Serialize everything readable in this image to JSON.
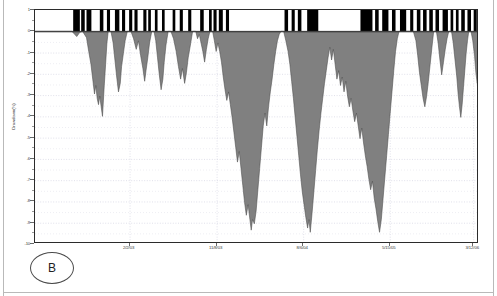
{
  "figure": {
    "panel_tag": "B",
    "background": "#ffffff",
    "frame_color": "#2b2b2b"
  },
  "chart_data": {
    "type": "area",
    "title": "",
    "subtitle": "",
    "xlabel": "",
    "ylabel": "Drawdown(%)",
    "ylim": [
      -10,
      1
    ],
    "yticks": [
      1,
      0,
      -1,
      -2,
      -3,
      -4,
      -5,
      -6,
      -7,
      -8,
      -9,
      -10
    ],
    "ytick_labels": [
      "1",
      "0",
      "-1",
      "-2",
      "-3",
      "-4",
      "-5",
      "-6",
      "-7",
      "-8",
      "-9",
      "-10"
    ],
    "minor_yticks": [
      0.5,
      -0.5,
      -1.5,
      -2.5,
      -3.5,
      -4.5,
      -5.5,
      -6.5,
      -7.5,
      -8.5,
      -9.5
    ],
    "grid": true,
    "grid_color": "#d8d8e4",
    "grid_style": "dotted",
    "legend": "none",
    "xtick_labels": [
      "2/2/03",
      "11/8/03",
      "8/6/04",
      "5/15/05",
      "3/12/06"
    ],
    "xtick_positions": [
      0.213,
      0.409,
      0.604,
      0.799,
      0.987
    ],
    "xlim_labels": [
      "",
      ""
    ],
    "series": [
      {
        "name": "Drawdown(%)",
        "fill_color": "#808080",
        "line_color": "#4a4a4a",
        "baseline": 0,
        "points": [
          [
            0.0,
            0.0
          ],
          [
            0.018,
            0.0
          ],
          [
            0.04,
            0.0
          ],
          [
            0.062,
            0.0
          ],
          [
            0.083,
            0.0
          ],
          [
            0.094,
            -0.25
          ],
          [
            0.101,
            -0.05
          ],
          [
            0.107,
            0.0
          ],
          [
            0.116,
            -0.3
          ],
          [
            0.121,
            -0.95
          ],
          [
            0.126,
            -1.55
          ],
          [
            0.13,
            -2.25
          ],
          [
            0.134,
            -2.95
          ],
          [
            0.137,
            -2.55
          ],
          [
            0.14,
            -3.15
          ],
          [
            0.143,
            -3.45
          ],
          [
            0.146,
            -3.05
          ],
          [
            0.149,
            -3.55
          ],
          [
            0.152,
            -4.0
          ],
          [
            0.156,
            -2.55
          ],
          [
            0.159,
            -1.55
          ],
          [
            0.162,
            -0.55
          ],
          [
            0.165,
            0.0
          ],
          [
            0.171,
            0.0
          ],
          [
            0.176,
            -0.55
          ],
          [
            0.18,
            -1.35
          ],
          [
            0.184,
            -2.15
          ],
          [
            0.188,
            -2.85
          ],
          [
            0.192,
            -2.45
          ],
          [
            0.195,
            -1.65
          ],
          [
            0.199,
            -1.05
          ],
          [
            0.203,
            -0.45
          ],
          [
            0.208,
            0.0
          ],
          [
            0.216,
            0.0
          ],
          [
            0.222,
            -0.35
          ],
          [
            0.228,
            -0.85
          ],
          [
            0.233,
            -0.45
          ],
          [
            0.238,
            -1.15
          ],
          [
            0.243,
            -1.75
          ],
          [
            0.247,
            -2.35
          ],
          [
            0.25,
            -1.85
          ],
          [
            0.254,
            -1.25
          ],
          [
            0.258,
            -0.55
          ],
          [
            0.263,
            0.0
          ],
          [
            0.268,
            0.0
          ],
          [
            0.272,
            -0.45
          ],
          [
            0.276,
            -1.25
          ],
          [
            0.28,
            -2.05
          ],
          [
            0.284,
            -2.75
          ],
          [
            0.288,
            -2.25
          ],
          [
            0.291,
            -1.45
          ],
          [
            0.295,
            -0.65
          ],
          [
            0.3,
            0.0
          ],
          [
            0.306,
            0.0
          ],
          [
            0.312,
            -0.35
          ],
          [
            0.318,
            -0.95
          ],
          [
            0.323,
            -1.65
          ],
          [
            0.328,
            -2.25
          ],
          [
            0.332,
            -1.75
          ],
          [
            0.337,
            -2.45
          ],
          [
            0.341,
            -1.95
          ],
          [
            0.345,
            -1.25
          ],
          [
            0.35,
            -0.65
          ],
          [
            0.355,
            0.0
          ],
          [
            0.362,
            0.0
          ],
          [
            0.366,
            -0.35
          ],
          [
            0.37,
            -0.15
          ],
          [
            0.374,
            -0.55
          ],
          [
            0.378,
            -0.95
          ],
          [
            0.382,
            -1.45
          ],
          [
            0.386,
            -0.85
          ],
          [
            0.39,
            -0.35
          ],
          [
            0.394,
            0.0
          ],
          [
            0.4,
            0.0
          ],
          [
            0.404,
            -0.45
          ],
          [
            0.408,
            -0.95
          ],
          [
            0.412,
            -0.55
          ],
          [
            0.416,
            -0.95
          ],
          [
            0.42,
            -1.45
          ],
          [
            0.424,
            -2.15
          ],
          [
            0.428,
            -2.75
          ],
          [
            0.432,
            -3.25
          ],
          [
            0.436,
            -2.85
          ],
          [
            0.44,
            -3.45
          ],
          [
            0.444,
            -4.05
          ],
          [
            0.448,
            -4.75
          ],
          [
            0.452,
            -5.45
          ],
          [
            0.456,
            -6.15
          ],
          [
            0.46,
            -5.65
          ],
          [
            0.464,
            -6.45
          ],
          [
            0.468,
            -7.25
          ],
          [
            0.472,
            -8.05
          ],
          [
            0.476,
            -8.65
          ],
          [
            0.48,
            -8.15
          ],
          [
            0.484,
            -8.85
          ],
          [
            0.487,
            -9.35
          ],
          [
            0.49,
            -8.85
          ],
          [
            0.494,
            -9.05
          ],
          [
            0.498,
            -8.45
          ],
          [
            0.502,
            -7.45
          ],
          [
            0.506,
            -6.45
          ],
          [
            0.51,
            -5.45
          ],
          [
            0.514,
            -4.45
          ],
          [
            0.518,
            -3.85
          ],
          [
            0.522,
            -4.45
          ],
          [
            0.526,
            -3.55
          ],
          [
            0.53,
            -2.85
          ],
          [
            0.534,
            -2.25
          ],
          [
            0.538,
            -1.55
          ],
          [
            0.542,
            -0.95
          ],
          [
            0.546,
            -0.45
          ],
          [
            0.55,
            -0.15
          ],
          [
            0.554,
            0.0
          ],
          [
            0.56,
            0.0
          ],
          [
            0.565,
            -0.45
          ],
          [
            0.57,
            -0.95
          ],
          [
            0.574,
            -1.55
          ],
          [
            0.578,
            -2.35
          ],
          [
            0.582,
            -3.15
          ],
          [
            0.586,
            -4.05
          ],
          [
            0.59,
            -4.95
          ],
          [
            0.594,
            -5.85
          ],
          [
            0.598,
            -6.75
          ],
          [
            0.602,
            -7.55
          ],
          [
            0.606,
            -8.15
          ],
          [
            0.61,
            -8.75
          ],
          [
            0.614,
            -9.25
          ],
          [
            0.617,
            -8.85
          ],
          [
            0.62,
            -9.45
          ],
          [
            0.624,
            -8.55
          ],
          [
            0.628,
            -7.55
          ],
          [
            0.632,
            -6.55
          ],
          [
            0.636,
            -5.55
          ],
          [
            0.64,
            -4.65
          ],
          [
            0.644,
            -3.85
          ],
          [
            0.648,
            -3.15
          ],
          [
            0.652,
            -2.45
          ],
          [
            0.656,
            -1.85
          ],
          [
            0.66,
            -1.25
          ],
          [
            0.664,
            -0.75
          ],
          [
            0.668,
            -1.35
          ],
          [
            0.672,
            -0.85
          ],
          [
            0.676,
            -1.55
          ],
          [
            0.68,
            -2.25
          ],
          [
            0.684,
            -1.85
          ],
          [
            0.688,
            -2.55
          ],
          [
            0.692,
            -2.15
          ],
          [
            0.696,
            -2.85
          ],
          [
            0.7,
            -2.35
          ],
          [
            0.704,
            -3.05
          ],
          [
            0.708,
            -3.55
          ],
          [
            0.712,
            -3.15
          ],
          [
            0.716,
            -3.75
          ],
          [
            0.72,
            -4.25
          ],
          [
            0.724,
            -3.85
          ],
          [
            0.728,
            -4.45
          ],
          [
            0.732,
            -5.05
          ],
          [
            0.736,
            -4.55
          ],
          [
            0.74,
            -5.25
          ],
          [
            0.744,
            -5.85
          ],
          [
            0.748,
            -6.35
          ],
          [
            0.752,
            -6.95
          ],
          [
            0.756,
            -7.45
          ],
          [
            0.76,
            -7.05
          ],
          [
            0.764,
            -7.85
          ],
          [
            0.768,
            -8.35
          ],
          [
            0.772,
            -8.95
          ],
          [
            0.776,
            -9.45
          ],
          [
            0.78,
            -8.85
          ],
          [
            0.784,
            -7.85
          ],
          [
            0.788,
            -6.85
          ],
          [
            0.792,
            -5.85
          ],
          [
            0.796,
            -4.85
          ],
          [
            0.8,
            -3.85
          ],
          [
            0.804,
            -2.85
          ],
          [
            0.808,
            -1.85
          ],
          [
            0.812,
            -0.95
          ],
          [
            0.816,
            -0.35
          ],
          [
            0.82,
            0.0
          ],
          [
            0.828,
            0.0
          ],
          [
            0.836,
            0.0
          ],
          [
            0.844,
            0.0
          ],
          [
            0.852,
            0.0
          ],
          [
            0.858,
            -0.45
          ],
          [
            0.862,
            -1.15
          ],
          [
            0.866,
            -1.95
          ],
          [
            0.87,
            -2.55
          ],
          [
            0.874,
            -3.15
          ],
          [
            0.878,
            -3.55
          ],
          [
            0.882,
            -3.05
          ],
          [
            0.886,
            -2.35
          ],
          [
            0.89,
            -1.55
          ],
          [
            0.894,
            -0.75
          ],
          [
            0.898,
            0.0
          ],
          [
            0.904,
            0.0
          ],
          [
            0.908,
            -0.55
          ],
          [
            0.912,
            -1.35
          ],
          [
            0.916,
            -2.05
          ],
          [
            0.92,
            -1.45
          ],
          [
            0.924,
            -0.85
          ],
          [
            0.928,
            -0.35
          ],
          [
            0.932,
            0.0
          ],
          [
            0.938,
            0.0
          ],
          [
            0.942,
            -0.55
          ],
          [
            0.946,
            -1.35
          ],
          [
            0.95,
            -2.15
          ],
          [
            0.953,
            -2.95
          ],
          [
            0.956,
            -3.55
          ],
          [
            0.959,
            -4.05
          ],
          [
            0.962,
            -3.45
          ],
          [
            0.965,
            -2.65
          ],
          [
            0.968,
            -1.85
          ],
          [
            0.971,
            -1.05
          ],
          [
            0.974,
            -0.45
          ],
          [
            0.977,
            0.0
          ],
          [
            0.982,
            0.0
          ],
          [
            0.986,
            -0.45
          ],
          [
            0.99,
            -1.15
          ],
          [
            0.993,
            -1.95
          ],
          [
            0.996,
            -2.45
          ],
          [
            0.999,
            -1.85
          ],
          [
            1.0,
            -1.05
          ]
        ]
      }
    ],
    "indicator_band": {
      "name": "regime-indicator",
      "description": "black/white on-off bars drawn between y=0 and y=1",
      "color_on": "#000000",
      "color_off": "#ffffff",
      "y_from": 0,
      "y_to": 1,
      "bars": [
        [
          0.086,
          0.101
        ],
        [
          0.104,
          0.112
        ],
        [
          0.116,
          0.127
        ],
        [
          0.146,
          0.154
        ],
        [
          0.162,
          0.169
        ],
        [
          0.18,
          0.19
        ],
        [
          0.196,
          0.203
        ],
        [
          0.212,
          0.219
        ],
        [
          0.224,
          0.231
        ],
        [
          0.244,
          0.251
        ],
        [
          0.255,
          0.261
        ],
        [
          0.27,
          0.276
        ],
        [
          0.286,
          0.292
        ],
        [
          0.31,
          0.316
        ],
        [
          0.326,
          0.333
        ],
        [
          0.345,
          0.352
        ],
        [
          0.372,
          0.38
        ],
        [
          0.392,
          0.398
        ],
        [
          0.402,
          0.409
        ],
        [
          0.414,
          0.423
        ],
        [
          0.43,
          0.437
        ],
        [
          0.562,
          0.57
        ],
        [
          0.578,
          0.585
        ],
        [
          0.592,
          0.6
        ],
        [
          0.613,
          0.638
        ],
        [
          0.733,
          0.76
        ],
        [
          0.766,
          0.774
        ],
        [
          0.782,
          0.796
        ],
        [
          0.804,
          0.812
        ],
        [
          0.822,
          0.836
        ],
        [
          0.845,
          0.852
        ],
        [
          0.86,
          0.868
        ],
        [
          0.874,
          0.882
        ],
        [
          0.888,
          0.896
        ],
        [
          0.902,
          0.91
        ],
        [
          0.918,
          0.93
        ],
        [
          0.936,
          0.942
        ],
        [
          0.948,
          0.954
        ],
        [
          0.96,
          0.968
        ],
        [
          0.974,
          0.982
        ],
        [
          0.988,
          0.995
        ]
      ]
    }
  }
}
